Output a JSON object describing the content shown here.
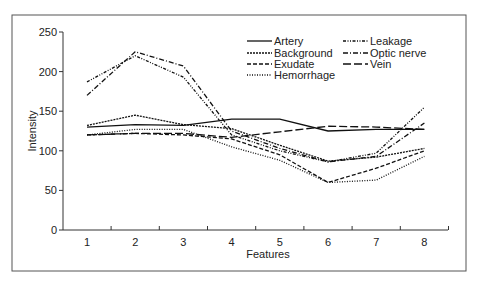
{
  "chart_data": {
    "type": "line",
    "title": "",
    "xlabel": "Features",
    "ylabel": "Intensity",
    "x": [
      1,
      2,
      3,
      4,
      5,
      6,
      7,
      8
    ],
    "ylim": [
      0,
      250
    ],
    "yticks": [
      0,
      50,
      100,
      150,
      200,
      250
    ],
    "grid": false,
    "legend_position": "upper right, two columns",
    "series": [
      {
        "name": "Artery",
        "style": "solid",
        "values": [
          130,
          133,
          132,
          140,
          140,
          125,
          127,
          127
        ]
      },
      {
        "name": "Background",
        "style": "fine-dash",
        "values": [
          132,
          145,
          133,
          128,
          107,
          87,
          92,
          103
        ]
      },
      {
        "name": "Exudate",
        "style": "dash",
        "values": [
          120,
          122,
          120,
          115,
          95,
          60,
          78,
          100
        ]
      },
      {
        "name": "Hemorrhage",
        "style": "dot",
        "values": [
          120,
          127,
          127,
          105,
          88,
          60,
          63,
          93
        ]
      },
      {
        "name": "Leakage",
        "style": "dash-dot-dot",
        "values": [
          187,
          220,
          193,
          120,
          100,
          86,
          97,
          155
        ]
      },
      {
        "name": "Optic nerve",
        "style": "dash-dot",
        "values": [
          170,
          225,
          207,
          125,
          103,
          86,
          93,
          135
        ]
      },
      {
        "name": "Vein",
        "style": "long-dash",
        "values": [
          120,
          122,
          122,
          117,
          124,
          131,
          130,
          127
        ]
      }
    ]
  }
}
